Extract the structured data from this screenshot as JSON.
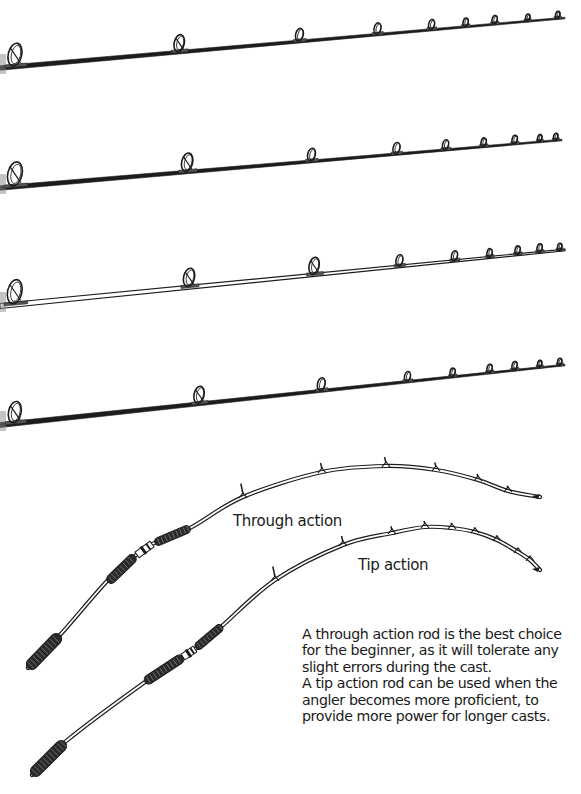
{
  "figure": {
    "ink_color": "#1c1c1c",
    "paper_color": "#ffffff",
    "straight_rods": [
      {
        "id": "rod-1",
        "style": "solid",
        "start": [
          0,
          68
        ],
        "end": [
          565,
          18
        ],
        "thickness": 4.5,
        "guides_x": [
          16,
          180,
          300,
          378,
          432,
          466,
          495,
          528,
          558
        ],
        "guide_sizes": [
          16,
          12,
          9,
          8,
          7,
          6,
          6,
          5,
          5
        ]
      },
      {
        "id": "rod-2",
        "style": "solid",
        "start": [
          0,
          188
        ],
        "end": [
          562,
          140
        ],
        "thickness": 4.5,
        "guides_x": [
          16,
          188,
          312,
          397,
          446,
          484,
          515,
          540,
          556
        ],
        "guide_sizes": [
          17,
          13,
          9,
          8,
          7,
          6,
          6,
          5,
          5
        ]
      },
      {
        "id": "rod-3",
        "style": "hollow",
        "start": [
          0,
          306
        ],
        "end": [
          565,
          250
        ],
        "thickness": 5,
        "guides_x": [
          16,
          190,
          315,
          400,
          455,
          490,
          518,
          540,
          560
        ],
        "guide_sizes": [
          17,
          13,
          12,
          8,
          7,
          6,
          6,
          6,
          5
        ]
      },
      {
        "id": "rod-4",
        "style": "solid",
        "start": [
          0,
          425
        ],
        "end": [
          565,
          365
        ],
        "thickness": 5,
        "guides_x": [
          16,
          200,
          322,
          408,
          453,
          490,
          515,
          540,
          560
        ],
        "guide_sizes": [
          15,
          12,
          9,
          7,
          6,
          6,
          6,
          5,
          5
        ]
      }
    ],
    "bent_rods": [
      {
        "id": "through-action-rod",
        "label": "Through action",
        "path_points": [
          [
            28,
            668
          ],
          [
            60,
            635
          ],
          [
            108,
            580
          ],
          [
            135,
            556
          ],
          [
            150,
            545
          ],
          [
            190,
            528
          ],
          [
            243,
            497
          ],
          [
            322,
            472
          ],
          [
            386,
            466
          ],
          [
            436,
            470
          ],
          [
            478,
            480
          ],
          [
            508,
            491
          ],
          [
            540,
            497
          ]
        ],
        "butt_grip": [
          [
            28,
            668
          ],
          [
            60,
            635
          ]
        ],
        "fore_grip": [
          [
            108,
            582
          ],
          [
            135,
            556
          ]
        ],
        "reel_seat": [
          [
            137,
            555
          ],
          [
            152,
            544
          ]
        ],
        "upper_grip": [
          [
            155,
            543
          ],
          [
            190,
            528
          ]
        ],
        "guides": [
          [
            243,
            497,
            18
          ],
          [
            322,
            472,
            12
          ],
          [
            386,
            466,
            12
          ],
          [
            436,
            470,
            10
          ],
          [
            478,
            480,
            8
          ],
          [
            508,
            491,
            7
          ]
        ],
        "tip": [
          540,
          497
        ]
      },
      {
        "id": "tip-action-rod",
        "label": "Tip action",
        "path_points": [
          [
            32,
            775
          ],
          [
            65,
            742
          ],
          [
            145,
            682
          ],
          [
            185,
            656
          ],
          [
            195,
            649
          ],
          [
            222,
            626
          ],
          [
            275,
            580
          ],
          [
            343,
            545
          ],
          [
            392,
            533
          ],
          [
            425,
            527
          ],
          [
            452,
            528
          ],
          [
            475,
            532
          ],
          [
            497,
            540
          ],
          [
            518,
            552
          ],
          [
            530,
            560
          ],
          [
            540,
            570
          ]
        ],
        "butt_grip": [
          [
            32,
            775
          ],
          [
            65,
            742
          ]
        ],
        "fore_grip": [
          [
            145,
            682
          ],
          [
            183,
            657
          ]
        ],
        "reel_seat": [
          [
            183,
            657
          ],
          [
            195,
            649
          ]
        ],
        "upper_grip": [
          [
            196,
            648
          ],
          [
            222,
            626
          ]
        ],
        "guides": [
          [
            275,
            580,
            18
          ],
          [
            343,
            545,
            12
          ],
          [
            392,
            533,
            9
          ],
          [
            425,
            527,
            8
          ],
          [
            452,
            528,
            7
          ],
          [
            475,
            532,
            6
          ],
          [
            497,
            540,
            6
          ],
          [
            518,
            552,
            5
          ],
          [
            530,
            560,
            5
          ]
        ],
        "tip": [
          540,
          570
        ]
      }
    ],
    "captions": {
      "through_action": "Through action",
      "tip_action": "Tip action"
    },
    "description": {
      "paragraph_1": "A through action rod is the best choice for the beginner, as it will tolerate any slight errors during the cast.",
      "paragraph_2": "A tip action rod can be used when the angler becomes more proficient, to provide more power for longer casts."
    }
  }
}
